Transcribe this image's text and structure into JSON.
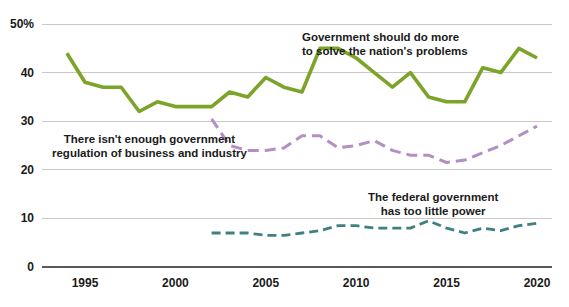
{
  "chart_data": {
    "type": "line",
    "title": "",
    "subtitle": "",
    "xlabel": "",
    "ylabel": "",
    "xlim": [
      1994,
      2020
    ],
    "ylim": [
      0,
      50
    ],
    "grid": true,
    "legend_position": "inline-annotations",
    "y_ticks": [
      "0",
      "10",
      "20",
      "30",
      "40",
      "50%"
    ],
    "y_tick_values": [
      0,
      10,
      20,
      30,
      40,
      50
    ],
    "x_ticks": [
      "1995",
      "2000",
      "2005",
      "2010",
      "2015",
      "2020"
    ],
    "x_tick_values": [
      1995,
      2000,
      2005,
      2010,
      2015,
      2020
    ],
    "series": [
      {
        "name": "Government should do more to solve the nation's problems",
        "label_line1": "Government should do more",
        "label_line2": "to solve the nation's problems",
        "color": "#7ba428",
        "dash": "none",
        "width": 3.6,
        "x": [
          1994,
          1995,
          1996,
          1997,
          1998,
          1999,
          2000,
          2001,
          2002,
          2003,
          2004,
          2005,
          2006,
          2007,
          2008,
          2009,
          2010,
          2011,
          2012,
          2013,
          2014,
          2015,
          2016,
          2017,
          2018,
          2019,
          2020
        ],
        "values": [
          44,
          38,
          37,
          37,
          32,
          34,
          33,
          33,
          33,
          36,
          35,
          39,
          37,
          36,
          45,
          45,
          43,
          40,
          37,
          40,
          35,
          34,
          34,
          41,
          40,
          45,
          43
        ]
      },
      {
        "name": "There isn't enough government regulation of business and industry",
        "label_line1": "There isn't enough government",
        "label_line2": "regulation of business and industry",
        "color": "#b48fc4",
        "dash": "11 6",
        "width": 3.0,
        "x": [
          2002,
          2003,
          2004,
          2005,
          2006,
          2007,
          2008,
          2009,
          2010,
          2011,
          2012,
          2013,
          2014,
          2015,
          2016,
          2017,
          2018,
          2019,
          2020
        ],
        "values": [
          30.5,
          25,
          24,
          24,
          24.5,
          27,
          27,
          24.5,
          25,
          26,
          24,
          23,
          23,
          21.5,
          22,
          23.5,
          25,
          27,
          29
        ]
      },
      {
        "name": "The federal government has too little power",
        "label_line1": "The federal government",
        "label_line2": "has too little power",
        "color": "#3f8080",
        "dash": "9 5",
        "width": 2.8,
        "x": [
          2002,
          2003,
          2004,
          2005,
          2006,
          2007,
          2008,
          2009,
          2010,
          2011,
          2012,
          2013,
          2014,
          2015,
          2016,
          2017,
          2018,
          2019,
          2020
        ],
        "values": [
          7,
          7,
          7,
          6.5,
          6.5,
          7,
          7.5,
          8.5,
          8.5,
          8,
          8,
          8,
          9.5,
          8,
          7,
          8,
          7.5,
          8.5,
          9
        ]
      }
    ]
  }
}
